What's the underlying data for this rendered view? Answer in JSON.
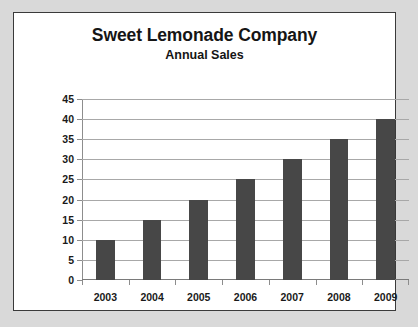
{
  "chart_data": {
    "type": "bar",
    "title": "Sweet Lemonade Company",
    "subtitle": "Annual Sales",
    "xlabel": "",
    "ylabel": "Sales ($ Millions)",
    "categories": [
      "2003",
      "2004",
      "2005",
      "2006",
      "2007",
      "2008",
      "2009"
    ],
    "values": [
      10,
      15,
      20,
      25,
      30,
      35,
      40
    ],
    "series": [
      {
        "name": "Annual Sales",
        "values": [
          10,
          15,
          20,
          25,
          30,
          35,
          40
        ]
      }
    ],
    "ylim": [
      0,
      45
    ],
    "ytick_step": 5,
    "ytick_labels": [
      "0",
      "5",
      "10",
      "15",
      "20",
      "25",
      "30",
      "35",
      "40",
      "45"
    ],
    "grid": true,
    "legend": false,
    "legend_position": "none",
    "bar_color": "#474747",
    "gridline_color": "#a8a8a8",
    "plot_background": "#ffffff",
    "page_background": "#d9d9d9",
    "frame_border_color": "#3a3a3a",
    "text_color": "#151515"
  }
}
